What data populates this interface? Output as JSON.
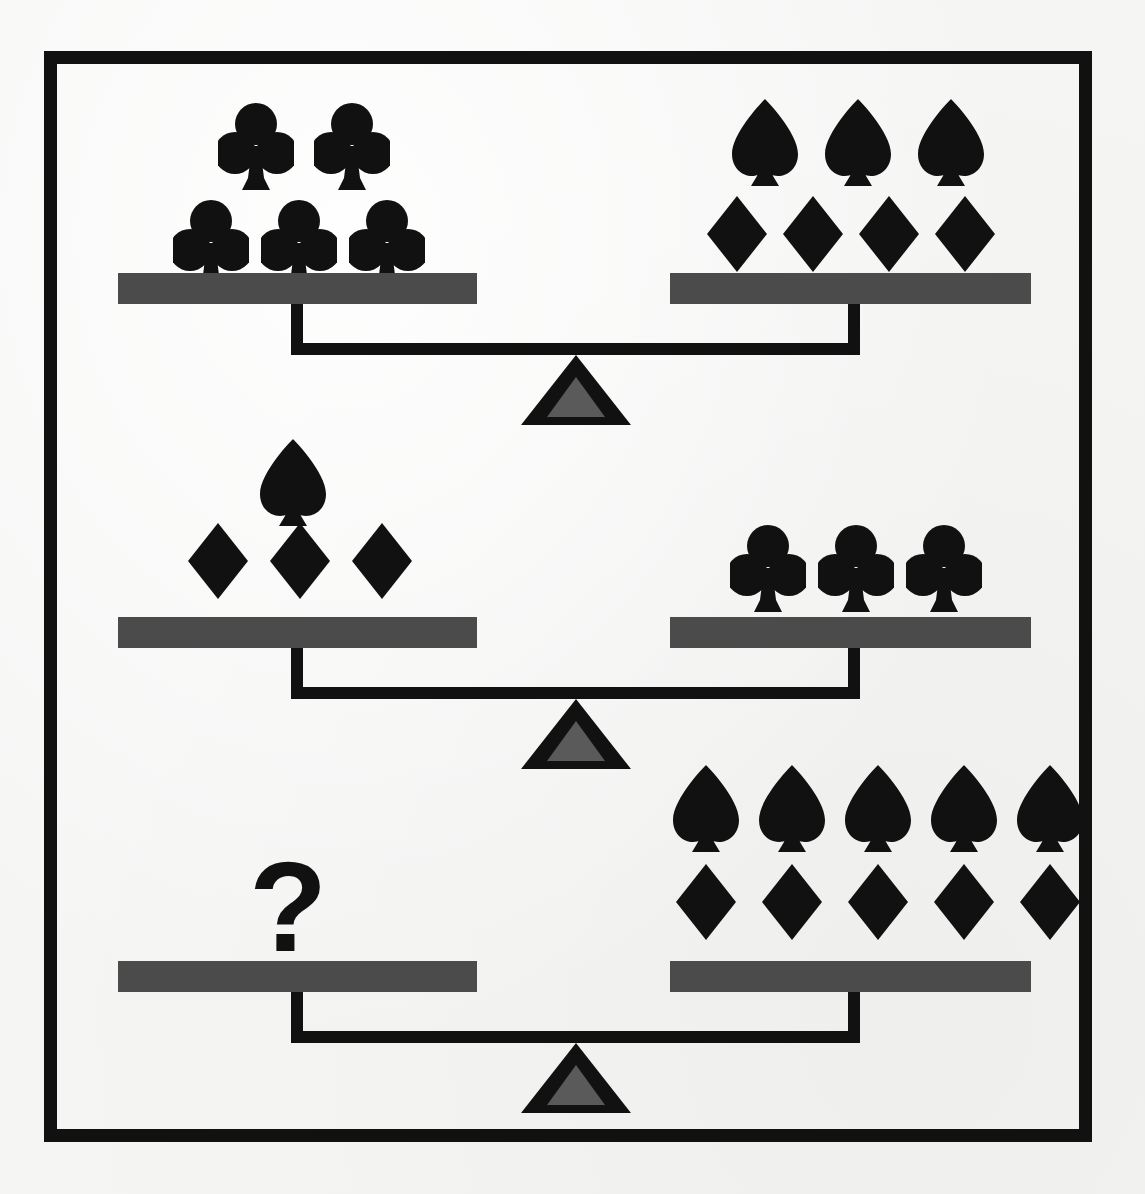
{
  "image": {
    "title": "Balance scale logic puzzle",
    "kind": "balance-puzzle",
    "background_color": "#f5f5f4",
    "frame_color": "#111111",
    "pan_color": "#4b4b4b",
    "beam_color": "#111111",
    "fulcrum_outer_color": "#111111",
    "fulcrum_inner_color": "#5a5a5a",
    "symbol_color": "#111111",
    "unknown_marker": "?"
  },
  "symbols": {
    "club": {
      "name": "club-icon",
      "label": "club",
      "glyph": "♣"
    },
    "spade": {
      "name": "spade-icon",
      "label": "spade",
      "glyph": "♠"
    },
    "diamond": {
      "name": "diamond-icon",
      "label": "diamond",
      "glyph": "♦"
    }
  },
  "balances": [
    {
      "id": "balance-1",
      "left": {
        "unknown": false,
        "rows": [
          {
            "symbol": "club",
            "count": 2
          },
          {
            "symbol": "club",
            "count": 3
          }
        ],
        "totals": {
          "club": 5,
          "spade": 0,
          "diamond": 0
        }
      },
      "right": {
        "unknown": false,
        "rows": [
          {
            "symbol": "spade",
            "count": 3
          },
          {
            "symbol": "diamond",
            "count": 4
          }
        ],
        "totals": {
          "club": 0,
          "spade": 3,
          "diamond": 4
        }
      },
      "relation": "equals"
    },
    {
      "id": "balance-2",
      "left": {
        "unknown": false,
        "rows": [
          {
            "symbol": "spade",
            "count": 1
          },
          {
            "symbol": "diamond",
            "count": 3
          }
        ],
        "totals": {
          "club": 0,
          "spade": 1,
          "diamond": 3
        }
      },
      "right": {
        "unknown": false,
        "rows": [
          {
            "symbol": "club",
            "count": 3
          }
        ],
        "totals": {
          "club": 3,
          "spade": 0,
          "diamond": 0
        }
      },
      "relation": "equals"
    },
    {
      "id": "balance-3",
      "left": {
        "unknown": true,
        "unknown_label": "?",
        "rows": [],
        "totals": {
          "club": 0,
          "spade": 0,
          "diamond": 0
        }
      },
      "right": {
        "unknown": false,
        "rows": [
          {
            "symbol": "spade",
            "count": 5
          },
          {
            "symbol": "diamond",
            "count": 5
          }
        ],
        "totals": {
          "club": 0,
          "spade": 5,
          "diamond": 5
        }
      },
      "relation": "equals"
    }
  ]
}
